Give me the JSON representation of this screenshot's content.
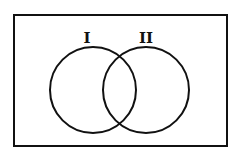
{
  "diagram": {
    "type": "venn",
    "universe": {
      "x": 14,
      "y": 15,
      "width": 213,
      "height": 131
    },
    "sets": [
      {
        "label": "I",
        "cx": 93,
        "cy": 90,
        "r": 43,
        "label_x": 87,
        "label_y": 42
      },
      {
        "label": "II",
        "cx": 146,
        "cy": 90,
        "r": 43,
        "label_x": 145,
        "label_y": 42
      }
    ],
    "stroke_color": "#111111",
    "background_color": "#ffffff"
  }
}
